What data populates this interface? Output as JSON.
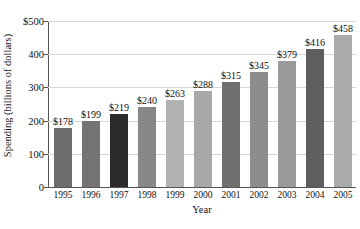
{
  "chart_data": {
    "type": "bar",
    "title": "",
    "xlabel": "Year",
    "ylabel": "Spending (billions of dollars)",
    "categories": [
      "1995",
      "1996",
      "1997",
      "1998",
      "1999",
      "2000",
      "2001",
      "2002",
      "2003",
      "2004",
      "2005"
    ],
    "values": [
      178,
      199,
      219,
      240,
      263,
      288,
      315,
      345,
      379,
      416,
      458
    ],
    "value_labels": [
      "$178",
      "$199",
      "$219",
      "$240",
      "$263",
      "$288",
      "$315",
      "$345",
      "$379",
      "$416",
      "$458"
    ],
    "bar_colors": [
      "#6d6d6d",
      "#747474",
      "#2b2b2b",
      "#888888",
      "#b2b2b2",
      "#a8a8a8",
      "#6f6f6f",
      "#8d8d8d",
      "#9a9a9a",
      "#5e5e5e",
      "#ababab"
    ],
    "ylim": [
      0,
      500
    ],
    "ytick_values": [
      0,
      100,
      200,
      300,
      400,
      500
    ],
    "ytick_labels": [
      "0",
      "100",
      "200",
      "300",
      "400",
      "$500"
    ],
    "grid": true,
    "grid_color": "#d8d8d8",
    "legend": "none",
    "axis_color": "#555555"
  }
}
